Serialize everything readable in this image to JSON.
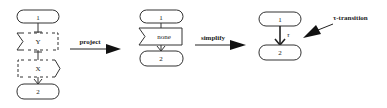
{
  "diagrams": {
    "original": {
      "start_node": "1",
      "activity_y": "Y",
      "activity_x": "X",
      "end_node": "2"
    },
    "projected": {
      "start_node": "1",
      "activity": "none",
      "end_node": "2"
    },
    "simplified": {
      "start_node": "1",
      "transition_label": "τ",
      "end_node": "2"
    }
  },
  "arrows": {
    "project_label": "project",
    "simplify_label": "simplify"
  },
  "annotation": {
    "label": "τ-transition"
  },
  "colors": {
    "stroke": "#333333",
    "text": "#222222",
    "background": "#ffffff"
  }
}
